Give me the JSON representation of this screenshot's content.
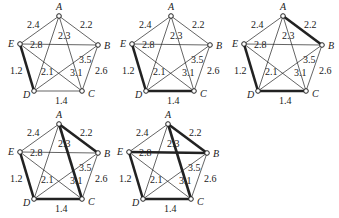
{
  "vertices": [
    "A",
    "B",
    "C",
    "D",
    "E"
  ],
  "edges": [
    {
      "id": "AE",
      "u": "A",
      "v": "E",
      "weight": "2.4"
    },
    {
      "id": "AB",
      "u": "A",
      "v": "B",
      "weight": "2.2"
    },
    {
      "id": "AC",
      "u": "A",
      "v": "C",
      "weight": "2.3"
    },
    {
      "id": "AD",
      "u": "A",
      "v": "D",
      "weight": "2.1"
    },
    {
      "id": "EB",
      "u": "E",
      "v": "B",
      "weight": "2.8"
    },
    {
      "id": "ED",
      "u": "E",
      "v": "D",
      "weight": "1.2"
    },
    {
      "id": "EC",
      "u": "E",
      "v": "C",
      "weight": "3.1"
    },
    {
      "id": "DB",
      "u": "D",
      "v": "B",
      "weight": "3.5"
    },
    {
      "id": "BC",
      "u": "B",
      "v": "C",
      "weight": "2.6"
    },
    {
      "id": "DC",
      "u": "D",
      "v": "C",
      "weight": "1.4"
    }
  ],
  "panels": [
    {
      "step": 1,
      "highlighted": [
        "ED"
      ]
    },
    {
      "step": 2,
      "highlighted": [
        "ED",
        "DC"
      ]
    },
    {
      "step": 3,
      "highlighted": [
        "ED",
        "DC",
        "AB"
      ]
    },
    {
      "step": 4,
      "highlighted": [
        "ED",
        "DC",
        "AB",
        "AC"
      ]
    },
    {
      "step": 5,
      "highlighted": [
        "ED",
        "DC",
        "AB",
        "AC",
        "EB"
      ]
    }
  ]
}
